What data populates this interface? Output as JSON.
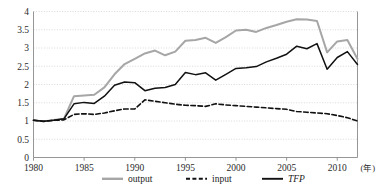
{
  "chart_data": {
    "type": "line",
    "title": "",
    "xlabel": "年",
    "ylabel": "",
    "xlim": [
      1980,
      2012
    ],
    "ylim": [
      0,
      4
    ],
    "ytick_step": 0.5,
    "yticks": [
      "0",
      "0.5",
      "1",
      "1.5",
      "2",
      "2.5",
      "3",
      "3.5",
      "4"
    ],
    "xticks": [
      "1980",
      "1985",
      "1990",
      "1995",
      "2000",
      "2005",
      "2010"
    ],
    "grid": "horizontal-dotted",
    "legend_position": "bottom",
    "x": [
      1980,
      1981,
      1982,
      1983,
      1984,
      1985,
      1986,
      1987,
      1988,
      1989,
      1990,
      1991,
      1992,
      1993,
      1994,
      1995,
      1996,
      1997,
      1998,
      1999,
      2000,
      2001,
      2002,
      2003,
      2004,
      2005,
      2006,
      2007,
      2008,
      2009,
      2010,
      2011,
      2012
    ],
    "series": [
      {
        "name": "output",
        "color": "#a6a6a6",
        "style": "solid",
        "values": [
          1.02,
          0.99,
          1.03,
          1.06,
          1.68,
          1.7,
          1.72,
          1.92,
          2.28,
          2.56,
          2.7,
          2.85,
          2.93,
          2.8,
          2.9,
          3.2,
          3.22,
          3.28,
          3.14,
          3.3,
          3.48,
          3.5,
          3.44,
          3.55,
          3.63,
          3.72,
          3.79,
          3.78,
          3.74,
          2.88,
          3.18,
          3.22,
          2.7
        ]
      },
      {
        "name": "input",
        "color": "#111111",
        "style": "dashed",
        "values": [
          1.02,
          0.99,
          1.02,
          1.03,
          1.18,
          1.2,
          1.18,
          1.22,
          1.28,
          1.33,
          1.33,
          1.58,
          1.54,
          1.5,
          1.46,
          1.43,
          1.42,
          1.4,
          1.47,
          1.44,
          1.42,
          1.4,
          1.38,
          1.36,
          1.34,
          1.32,
          1.26,
          1.24,
          1.22,
          1.2,
          1.15,
          1.09,
          1.0
        ]
      },
      {
        "name": "TFP",
        "color": "#111111",
        "style": "solid",
        "italic_label": true,
        "values": [
          1.02,
          0.99,
          1.02,
          1.06,
          1.47,
          1.51,
          1.48,
          1.68,
          1.98,
          2.07,
          2.05,
          1.83,
          1.9,
          1.92,
          2.0,
          2.33,
          2.27,
          2.32,
          2.12,
          2.28,
          2.44,
          2.46,
          2.49,
          2.62,
          2.72,
          2.83,
          3.05,
          2.98,
          3.12,
          2.42,
          2.74,
          2.9,
          2.55
        ]
      }
    ]
  },
  "legend": {
    "items": [
      {
        "label": "output"
      },
      {
        "label": "input"
      },
      {
        "label": "TFP"
      }
    ]
  },
  "axis": {
    "x_unit": "(年)"
  }
}
